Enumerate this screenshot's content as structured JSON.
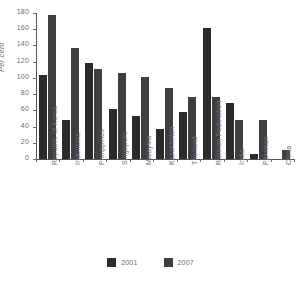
{
  "chart_data": {
    "type": "bar",
    "title": "",
    "subtitle": "",
    "xlabel": "",
    "ylabel": "Per cent",
    "ylim": [
      0,
      180
    ],
    "yticks": [
      0,
      20,
      40,
      60,
      80,
      100,
      120,
      140,
      160,
      180
    ],
    "grid": false,
    "legend_position": "bottom",
    "categories": [
      "Republic of Korea",
      "Indonesia",
      "Philippines",
      "Singapore",
      "Malaysia",
      "Kazakhstan",
      "Thailand",
      "Russian Federation",
      "India",
      "Pakistan",
      "China"
    ],
    "series": [
      {
        "name": "2001",
        "color": "#2b2b2b",
        "values": [
          103,
          48,
          118,
          62,
          53,
          37,
          58,
          161,
          69,
          6,
          0
        ]
      },
      {
        "name": "2007",
        "color": "#3f3f3f",
        "values": [
          177,
          137,
          111,
          106,
          101,
          88,
          76,
          76,
          48,
          48,
          11
        ]
      }
    ]
  },
  "axis": {
    "y_unit_label": "Per cent"
  },
  "legend": {
    "items": [
      {
        "label": "2001",
        "color": "#2b2b2b"
      },
      {
        "label": "2007",
        "color": "#3f3f3f"
      }
    ]
  }
}
